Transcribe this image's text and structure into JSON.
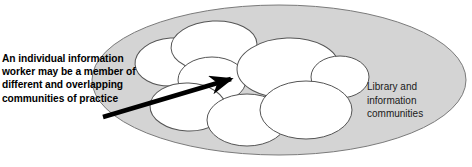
{
  "figure": {
    "type": "venn-cluster-diagram",
    "title": "",
    "annotations": {
      "left_label": "An individual information worker may be a member of different and overlapping communities of practice",
      "right_label": "Library and information communities"
    },
    "colors": {
      "outer_ellipse_fill": "#d4d4d4",
      "outer_ellipse_stroke": "#7a7a7a",
      "inner_ellipse_fill": "#ffffff",
      "inner_ellipse_stroke": "#555555",
      "arrow": "#000000",
      "text": "#000000",
      "background": "#ffffff"
    },
    "outer_ellipse": {
      "name": "library-and-information-communities",
      "cx": 279,
      "cy": 80,
      "rx": 187,
      "ry": 75
    },
    "inner_ellipses": [
      {
        "name": "community-of-practice-1",
        "cx": 172,
        "cy": 62,
        "rx": 37,
        "ry": 24,
        "rot": -4
      },
      {
        "name": "community-of-practice-2",
        "cx": 214,
        "cy": 46,
        "rx": 43,
        "ry": 25,
        "rot": -3
      },
      {
        "name": "community-of-practice-3",
        "cx": 212,
        "cy": 80,
        "rx": 34,
        "ry": 23,
        "rot": 0
      },
      {
        "name": "community-of-practice-4",
        "cx": 188,
        "cy": 107,
        "rx": 38,
        "ry": 24,
        "rot": 2
      },
      {
        "name": "community-of-practice-5",
        "cx": 247,
        "cy": 120,
        "rx": 40,
        "ry": 26,
        "rot": 0
      },
      {
        "name": "community-of-practice-6",
        "cx": 288,
        "cy": 68,
        "rx": 51,
        "ry": 30,
        "rot": -2
      },
      {
        "name": "community-of-practice-7",
        "cx": 340,
        "cy": 77,
        "rx": 29,
        "ry": 21,
        "rot": 0
      },
      {
        "name": "community-of-practice-8",
        "cx": 306,
        "cy": 110,
        "rx": 46,
        "ry": 29,
        "rot": 0
      }
    ],
    "arrow": {
      "name": "individual-worker-pointer",
      "x1": 103,
      "y1": 117,
      "x2": 237,
      "y2": 77,
      "width": 4.5
    }
  }
}
